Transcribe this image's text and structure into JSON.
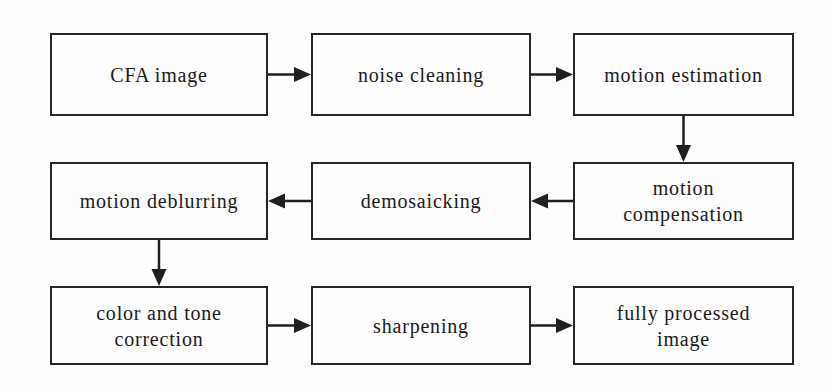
{
  "diagram": {
    "type": "flowchart",
    "nodes": {
      "cfa_image": {
        "label": "CFA image"
      },
      "noise_cleaning": {
        "label": "noise cleaning"
      },
      "motion_estimation": {
        "label": "motion estimation"
      },
      "motion_compensation": {
        "label": "motion\ncompensation"
      },
      "demosaicking": {
        "label": "demosaicking"
      },
      "motion_deblurring": {
        "label": "motion deblurring"
      },
      "color_tone_correction": {
        "label": "color and tone\ncorrection"
      },
      "sharpening": {
        "label": "sharpening"
      },
      "fully_processed_image": {
        "label": "fully processed\nimage"
      }
    },
    "edges": [
      {
        "from": "cfa_image",
        "to": "noise_cleaning",
        "direction": "right"
      },
      {
        "from": "noise_cleaning",
        "to": "motion_estimation",
        "direction": "right"
      },
      {
        "from": "motion_estimation",
        "to": "motion_compensation",
        "direction": "down"
      },
      {
        "from": "motion_compensation",
        "to": "demosaicking",
        "direction": "left"
      },
      {
        "from": "demosaicking",
        "to": "motion_deblurring",
        "direction": "left"
      },
      {
        "from": "motion_deblurring",
        "to": "color_tone_correction",
        "direction": "down"
      },
      {
        "from": "color_tone_correction",
        "to": "sharpening",
        "direction": "right"
      },
      {
        "from": "sharpening",
        "to": "fully_processed_image",
        "direction": "right"
      }
    ],
    "colors": {
      "line": "#1f1f1f",
      "text": "#1a1a1a",
      "box_border": "#262626",
      "background": "#fdfdfd"
    }
  }
}
